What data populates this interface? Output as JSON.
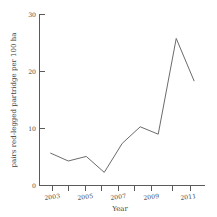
{
  "chart_data": {
    "type": "line",
    "title": "",
    "xlabel": "Year",
    "ylabel": "pairs red-legged partridge per 100 ha",
    "x": [
      2003,
      2004,
      2005,
      2006,
      2007,
      2008,
      2009,
      2010,
      2011
    ],
    "values": [
      5.7,
      4.3,
      5.1,
      2.3,
      7.4,
      10.3,
      9.0,
      25.8,
      18.3
    ],
    "series": [
      {
        "name": "pairs red-legged partridge per 100 ha",
        "values": [
          5.7,
          4.3,
          5.1,
          2.3,
          7.4,
          10.3,
          9.0,
          25.8,
          18.3
        ]
      }
    ],
    "xlim": [
      2002.4,
      2011.6
    ],
    "ylim": [
      0,
      30
    ],
    "xticks": [
      2003,
      2004,
      2005,
      2006,
      2007,
      2008,
      2009,
      2010,
      2011
    ],
    "xtick_labels": [
      "2003",
      "",
      "2005",
      "",
      "2007",
      "",
      "2009",
      "",
      "2011"
    ],
    "yticks": [
      0,
      10,
      20,
      30
    ],
    "ytick_labels": [
      "0",
      "10",
      "20",
      "30"
    ],
    "grid": false,
    "legend": false,
    "line_color": "#6b6b6b",
    "axis_color": "#5a5a5a"
  },
  "axis": {
    "y_label": "pairs red-legged partridge per 100 ha",
    "x_label": "Year",
    "y_ticks": [
      "0",
      "10",
      "20",
      "30"
    ],
    "x_ticks": [
      "2003",
      "2005",
      "2007",
      "2009",
      "2011"
    ]
  }
}
